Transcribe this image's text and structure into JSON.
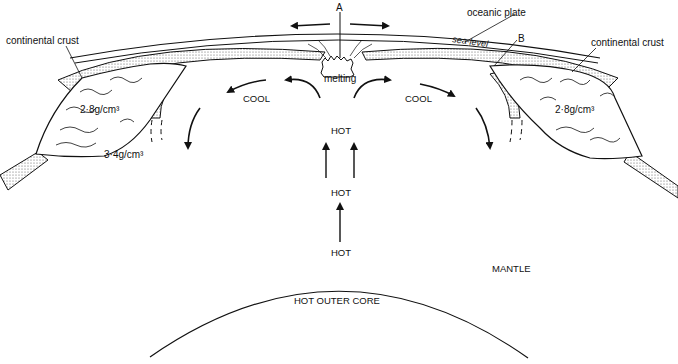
{
  "diagram": {
    "labels": {
      "point_a": "A",
      "point_b": "B",
      "oceanic_plate": "oceanic plate",
      "sea_level": "sea-level",
      "continental_crust_left": "continental crust",
      "continental_crust_right": "continental crust",
      "density_left_crust": "2·8g/cm³",
      "density_right_crust": "2·8g/cm³",
      "density_mantle": "3·4g/cm³",
      "melting": "melting",
      "cool_left": "COOL",
      "cool_right": "COOL",
      "hot_top": "HOT",
      "hot_middle": "HOT",
      "hot_bottom": "HOT",
      "mantle": "MANTLE",
      "outer_core": "HOT OUTER CORE"
    },
    "colors": {
      "ink": "#111111",
      "background": "#ffffff",
      "stipple": "#555555"
    }
  }
}
